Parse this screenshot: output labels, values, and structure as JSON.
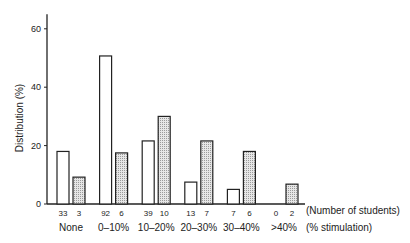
{
  "chart_data": {
    "type": "bar",
    "title": "",
    "xlabel": "(% stimulation)",
    "count_label": "(Number of students)",
    "ylabel": "Distribution (%)",
    "ylim": [
      0,
      65
    ],
    "yticks": [
      0,
      20,
      40,
      60
    ],
    "categories": [
      "None",
      "0–10%",
      "10–20%",
      "20–30%",
      "30–40%",
      ">40%"
    ],
    "series": [
      {
        "name": "group-1",
        "fill": "open",
        "values": [
          18,
          50.7,
          21.6,
          7.5,
          5,
          0
        ],
        "counts": [
          "33",
          "92",
          "39",
          "13",
          "7",
          "0"
        ]
      },
      {
        "name": "group-2",
        "fill": "shaded",
        "values": [
          9.2,
          17.5,
          30,
          21.6,
          18,
          6.8
        ],
        "counts": [
          "3",
          "6",
          "10",
          "7",
          "6",
          "2"
        ]
      }
    ],
    "grid": false,
    "legend": "none"
  },
  "colors": {
    "axis": "#222222",
    "bar_stroke": "#222222",
    "open_fill": "#ffffff",
    "shaded_fill": "#d4d4d4"
  }
}
